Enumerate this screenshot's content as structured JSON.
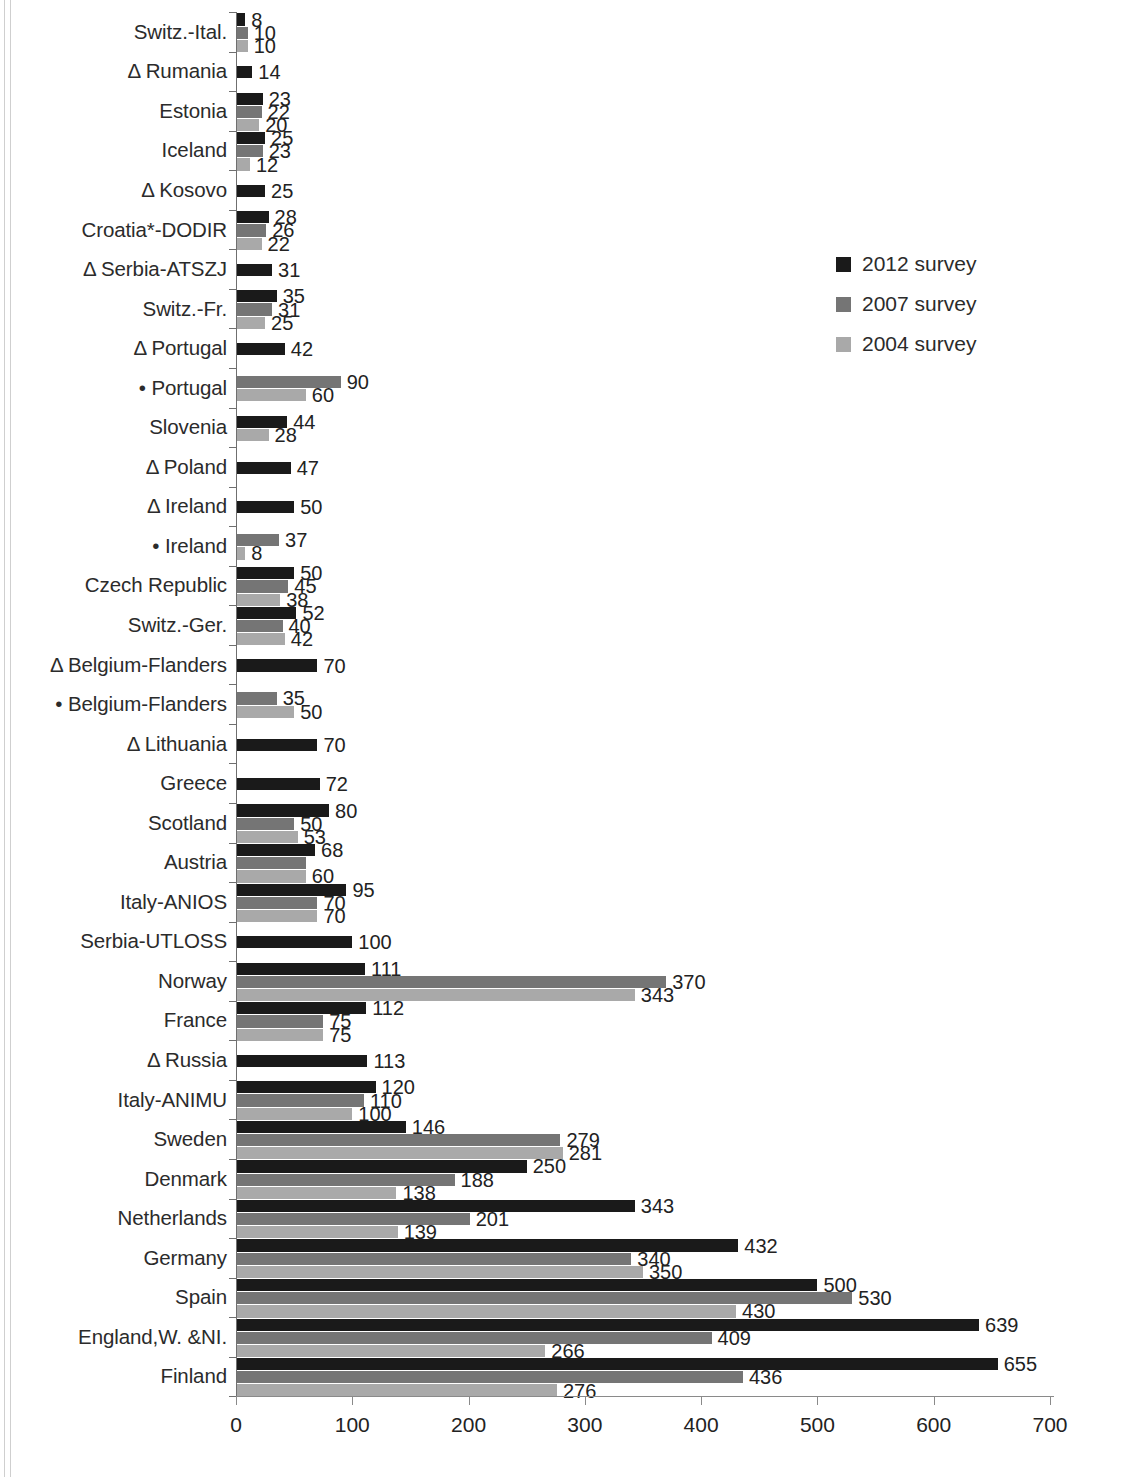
{
  "chart_data": {
    "type": "bar",
    "orientation": "horizontal",
    "title": "",
    "xlabel": "",
    "ylabel": "",
    "xlim": [
      0,
      700
    ],
    "xticks": [
      0,
      100,
      200,
      300,
      400,
      500,
      600,
      700
    ],
    "xtick_labels": [
      "0",
      "100",
      "200",
      "300",
      "400",
      "500",
      "600",
      "700"
    ],
    "grid": false,
    "legend_position": "right",
    "colors": {
      "2012 survey": "#1a1a1a",
      "2007 survey": "#757575",
      "2004 survey": "#a9a9a9"
    },
    "legend": [
      {
        "label": "2012 survey",
        "color": "#1a1a1a"
      },
      {
        "label": "2007 survey",
        "color": "#757575"
      },
      {
        "label": "2004 survey",
        "color": "#a9a9a9"
      }
    ],
    "categories": [
      "Switz.-Ital.",
      "Δ Rumania",
      "Estonia",
      "Iceland",
      "Δ Kosovo",
      "Croatia*-DODIR",
      "Δ Serbia-ATSZJ",
      "Switz.-Fr.",
      "Δ Portugal",
      "• Portugal",
      "Slovenia",
      "Δ Poland",
      "Δ Ireland",
      "• Ireland",
      "Czech Republic",
      "Switz.-Ger.",
      "Δ Belgium-Flanders",
      "• Belgium-Flanders",
      "Δ Lithuania",
      "Greece",
      "Scotland",
      "Austria",
      "Italy-ANIOS",
      "Serbia-UTLOSS",
      "Norway",
      "France",
      "Δ Russia",
      "Italy-ANIMU",
      "Sweden",
      "Denmark",
      "Netherlands",
      "Germany",
      "Spain",
      "England,W. &NI.",
      "Finland"
    ],
    "series": [
      {
        "name": "2012 survey",
        "values": [
          8,
          14,
          23,
          25,
          25,
          28,
          31,
          35,
          42,
          null,
          44,
          47,
          50,
          null,
          50,
          52,
          70,
          null,
          70,
          72,
          80,
          68,
          95,
          100,
          111,
          112,
          113,
          120,
          146,
          250,
          343,
          432,
          500,
          639,
          655
        ]
      },
      {
        "name": "2007 survey",
        "values": [
          10,
          null,
          22,
          23,
          null,
          26,
          null,
          31,
          null,
          90,
          null,
          null,
          null,
          37,
          45,
          40,
          null,
          35,
          null,
          null,
          50,
          60,
          70,
          null,
          370,
          75,
          null,
          110,
          279,
          188,
          201,
          340,
          530,
          409,
          436
        ]
      },
      {
        "name": "2004 survey",
        "values": [
          10,
          null,
          20,
          12,
          null,
          22,
          null,
          25,
          null,
          60,
          28,
          null,
          null,
          8,
          38,
          42,
          null,
          50,
          null,
          null,
          53,
          60,
          70,
          null,
          343,
          75,
          null,
          100,
          281,
          138,
          139,
          350,
          430,
          266,
          276
        ]
      }
    ],
    "rows": [
      {
        "category": "Switz.-Ital.",
        "bars": [
          {
            "series": "2012 survey",
            "value": 8,
            "label": "8"
          },
          {
            "series": "2007 survey",
            "value": 10,
            "label": "10"
          },
          {
            "series": "2004 survey",
            "value": 10,
            "label": "10"
          }
        ]
      },
      {
        "category": "Δ Rumania",
        "bars": [
          {
            "series": "2012 survey",
            "value": 14,
            "label": "14"
          }
        ]
      },
      {
        "category": "Estonia",
        "bars": [
          {
            "series": "2012 survey",
            "value": 23,
            "label": "23"
          },
          {
            "series": "2007 survey",
            "value": 22,
            "label": "22"
          },
          {
            "series": "2004 survey",
            "value": 20,
            "label": "20"
          }
        ]
      },
      {
        "category": "Iceland",
        "bars": [
          {
            "series": "2012 survey",
            "value": 25,
            "label": "25"
          },
          {
            "series": "2007 survey",
            "value": 23,
            "label": "23"
          },
          {
            "series": "2004 survey",
            "value": 12,
            "label": "12"
          }
        ]
      },
      {
        "category": "Δ Kosovo",
        "bars": [
          {
            "series": "2012 survey",
            "value": 25,
            "label": "25"
          }
        ]
      },
      {
        "category": "Croatia*-DODIR",
        "bars": [
          {
            "series": "2012 survey",
            "value": 28,
            "label": "28"
          },
          {
            "series": "2007 survey",
            "value": 26,
            "label": "26"
          },
          {
            "series": "2004 survey",
            "value": 22,
            "label": "22"
          }
        ]
      },
      {
        "category": "Δ Serbia-ATSZJ",
        "bars": [
          {
            "series": "2012 survey",
            "value": 31,
            "label": "31"
          }
        ]
      },
      {
        "category": "Switz.-Fr.",
        "bars": [
          {
            "series": "2012 survey",
            "value": 35,
            "label": "35"
          },
          {
            "series": "2007 survey",
            "value": 31,
            "label": "31"
          },
          {
            "series": "2004 survey",
            "value": 25,
            "label": "25"
          }
        ]
      },
      {
        "category": "Δ Portugal",
        "bars": [
          {
            "series": "2012 survey",
            "value": 42,
            "label": "42"
          }
        ]
      },
      {
        "category": "• Portugal",
        "bars": [
          {
            "series": "2007 survey",
            "value": 90,
            "label": "90"
          },
          {
            "series": "2004 survey",
            "value": 60,
            "label": "60"
          }
        ]
      },
      {
        "category": "Slovenia",
        "bars": [
          {
            "series": "2012 survey",
            "value": 44,
            "label": "44"
          },
          {
            "series": "2004 survey",
            "value": 28,
            "label": "28"
          }
        ]
      },
      {
        "category": "Δ Poland",
        "bars": [
          {
            "series": "2012 survey",
            "value": 47,
            "label": "47"
          }
        ]
      },
      {
        "category": "Δ Ireland",
        "bars": [
          {
            "series": "2012 survey",
            "value": 50,
            "label": "50"
          }
        ]
      },
      {
        "category": "• Ireland",
        "bars": [
          {
            "series": "2007 survey",
            "value": 37,
            "label": "37"
          },
          {
            "series": "2004 survey",
            "value": 8,
            "label": "8"
          }
        ]
      },
      {
        "category": "Czech Republic",
        "bars": [
          {
            "series": "2012 survey",
            "value": 50,
            "label": "50"
          },
          {
            "series": "2007 survey",
            "value": 45,
            "label": "45"
          },
          {
            "series": "2004 survey",
            "value": 38,
            "label": "38"
          }
        ]
      },
      {
        "category": "Switz.-Ger.",
        "bars": [
          {
            "series": "2012 survey",
            "value": 52,
            "label": "52"
          },
          {
            "series": "2007 survey",
            "value": 40,
            "label": "40"
          },
          {
            "series": "2004 survey",
            "value": 42,
            "label": "42"
          }
        ]
      },
      {
        "category": "Δ Belgium-Flanders",
        "bars": [
          {
            "series": "2012 survey",
            "value": 70,
            "label": "70"
          }
        ]
      },
      {
        "category": "• Belgium-Flanders",
        "bars": [
          {
            "series": "2007 survey",
            "value": 35,
            "label": "35"
          },
          {
            "series": "2004 survey",
            "value": 50,
            "label": "50"
          }
        ]
      },
      {
        "category": "Δ Lithuania",
        "bars": [
          {
            "series": "2012 survey",
            "value": 70,
            "label": "70"
          }
        ]
      },
      {
        "category": "Greece",
        "bars": [
          {
            "series": "2012 survey",
            "value": 72,
            "label": "72"
          }
        ]
      },
      {
        "category": "Scotland",
        "bars": [
          {
            "series": "2012 survey",
            "value": 80,
            "label": "80"
          },
          {
            "series": "2007 survey",
            "value": 50,
            "label": "50"
          },
          {
            "series": "2004 survey",
            "value": 53,
            "label": "53"
          }
        ]
      },
      {
        "category": "Austria",
        "bars": [
          {
            "series": "2012 survey",
            "value": 68,
            "label": "68"
          },
          {
            "series": "2007 survey",
            "value": 60,
            "label": ""
          },
          {
            "series": "2004 survey",
            "value": 60,
            "label": "60"
          }
        ]
      },
      {
        "category": "Italy-ANIOS",
        "bars": [
          {
            "series": "2012 survey",
            "value": 95,
            "label": "95"
          },
          {
            "series": "2007 survey",
            "value": 70,
            "label": "70"
          },
          {
            "series": "2004 survey",
            "value": 70,
            "label": "70"
          }
        ]
      },
      {
        "category": "Serbia-UTLOSS",
        "bars": [
          {
            "series": "2012 survey",
            "value": 100,
            "label": "100"
          }
        ]
      },
      {
        "category": "Norway",
        "bars": [
          {
            "series": "2012 survey",
            "value": 111,
            "label": "111"
          },
          {
            "series": "2007 survey",
            "value": 370,
            "label": "370"
          },
          {
            "series": "2004 survey",
            "value": 343,
            "label": "343"
          }
        ]
      },
      {
        "category": "France",
        "bars": [
          {
            "series": "2012 survey",
            "value": 112,
            "label": "112"
          },
          {
            "series": "2007 survey",
            "value": 75,
            "label": "75"
          },
          {
            "series": "2004 survey",
            "value": 75,
            "label": "75"
          }
        ]
      },
      {
        "category": "Δ Russia",
        "bars": [
          {
            "series": "2012 survey",
            "value": 113,
            "label": "113"
          }
        ]
      },
      {
        "category": "Italy-ANIMU",
        "bars": [
          {
            "series": "2012 survey",
            "value": 120,
            "label": "120"
          },
          {
            "series": "2007 survey",
            "value": 110,
            "label": "110"
          },
          {
            "series": "2004 survey",
            "value": 100,
            "label": "100"
          }
        ]
      },
      {
        "category": "Sweden",
        "bars": [
          {
            "series": "2012 survey",
            "value": 146,
            "label": "146"
          },
          {
            "series": "2007 survey",
            "value": 279,
            "label": "279"
          },
          {
            "series": "2004 survey",
            "value": 281,
            "label": "281"
          }
        ]
      },
      {
        "category": "Denmark",
        "bars": [
          {
            "series": "2012 survey",
            "value": 250,
            "label": "250"
          },
          {
            "series": "2007 survey",
            "value": 188,
            "label": "188"
          },
          {
            "series": "2004 survey",
            "value": 138,
            "label": "138"
          }
        ]
      },
      {
        "category": "Netherlands",
        "bars": [
          {
            "series": "2012 survey",
            "value": 343,
            "label": "343"
          },
          {
            "series": "2007 survey",
            "value": 201,
            "label": "201"
          },
          {
            "series": "2004 survey",
            "value": 139,
            "label": "139"
          }
        ]
      },
      {
        "category": "Germany",
        "bars": [
          {
            "series": "2012 survey",
            "value": 432,
            "label": "432"
          },
          {
            "series": "2007 survey",
            "value": 340,
            "label": "340"
          },
          {
            "series": "2004 survey",
            "value": 350,
            "label": "350"
          }
        ]
      },
      {
        "category": "Spain",
        "bars": [
          {
            "series": "2012 survey",
            "value": 500,
            "label": "500"
          },
          {
            "series": "2007 survey",
            "value": 530,
            "label": "530"
          },
          {
            "series": "2004 survey",
            "value": 430,
            "label": "430"
          }
        ]
      },
      {
        "category": "England,W. &NI.",
        "bars": [
          {
            "series": "2012 survey",
            "value": 639,
            "label": "639"
          },
          {
            "series": "2007 survey",
            "value": 409,
            "label": "409"
          },
          {
            "series": "2004 survey",
            "value": 266,
            "label": "266"
          }
        ]
      },
      {
        "category": "Finland",
        "bars": [
          {
            "series": "2012 survey",
            "value": 655,
            "label": "655"
          },
          {
            "series": "2007 survey",
            "value": 436,
            "label": "436"
          },
          {
            "series": "2004 survey",
            "value": 276,
            "label": "276"
          }
        ]
      }
    ]
  }
}
